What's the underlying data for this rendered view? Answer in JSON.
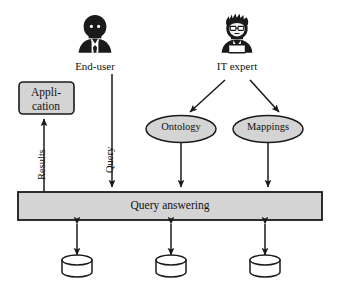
{
  "diagram": {
    "background_color": "#ffffff",
    "stroke_color": "#1a1a1a",
    "fill_gray": "#d4d4d4",
    "fill_white": "#ffffff"
  },
  "actors": [
    {
      "id": "end-user",
      "label": "End-user",
      "icon": "user-avatar-icon",
      "x": 95,
      "y": 40
    },
    {
      "id": "it-expert",
      "label": "IT expert",
      "icon": "developer-avatar-icon",
      "x": 237,
      "y": 40
    }
  ],
  "boxes": [
    {
      "id": "application",
      "lines": [
        "Appli-",
        "cation"
      ],
      "shape": "rounded-rect",
      "fill": "#d4d4d4"
    },
    {
      "id": "query-answering",
      "label": "Query answering",
      "shape": "rect",
      "fill": "#d4d4d4"
    }
  ],
  "ellipses": [
    {
      "id": "ontology",
      "label": "Ontology",
      "fill": "#d4d4d4"
    },
    {
      "id": "mappings",
      "label": "Mappings",
      "fill": "#d4d4d4"
    }
  ],
  "datastores": [
    {
      "id": "datastore-1",
      "shape": "cylinder",
      "fill": "#ffffff"
    },
    {
      "id": "datastore-2",
      "shape": "cylinder",
      "fill": "#ffffff"
    },
    {
      "id": "datastore-3",
      "shape": "cylinder",
      "fill": "#ffffff"
    }
  ],
  "edges": [
    {
      "id": "results",
      "label": "Results",
      "from": "query-answering",
      "to": "application",
      "orientation": "vertical-up",
      "rotated_label": true
    },
    {
      "id": "query",
      "label": "Query",
      "from": "end-user",
      "to": "query-answering",
      "orientation": "vertical-down",
      "rotated_label": true
    },
    {
      "id": "expert-to-ontology",
      "label": "",
      "from": "it-expert",
      "to": "ontology",
      "orientation": "diagonal-down-left"
    },
    {
      "id": "expert-to-mappings",
      "label": "",
      "from": "it-expert",
      "to": "mappings",
      "orientation": "diagonal-down-right"
    },
    {
      "id": "ontology-to-qa",
      "label": "",
      "from": "ontology",
      "to": "query-answering",
      "orientation": "vertical-down"
    },
    {
      "id": "mappings-to-qa",
      "label": "",
      "from": "mappings",
      "to": "query-answering",
      "orientation": "vertical-down"
    },
    {
      "id": "qa-to-datastore-1",
      "label": "",
      "from": "query-answering",
      "to": "datastore-1",
      "orientation": "bidirectional-vertical"
    },
    {
      "id": "qa-to-datastore-2",
      "label": "",
      "from": "query-answering",
      "to": "datastore-2",
      "orientation": "bidirectional-vertical"
    },
    {
      "id": "qa-to-datastore-3",
      "label": "",
      "from": "query-answering",
      "to": "datastore-3",
      "orientation": "bidirectional-vertical"
    }
  ]
}
